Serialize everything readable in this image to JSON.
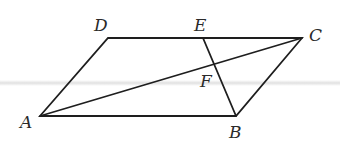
{
  "figure": {
    "type": "parallelogram",
    "points": {
      "A": [
        40,
        116
      ],
      "B": [
        236,
        116
      ],
      "C": [
        302,
        38
      ],
      "D": [
        108,
        38
      ],
      "E": [
        203,
        38
      ],
      "F": [
        214,
        64
      ]
    },
    "segments": [
      "AB",
      "BC",
      "CD",
      "DA",
      "AC",
      "EB"
    ],
    "labels": {
      "A": "A",
      "B": "B",
      "C": "C",
      "D": "D",
      "E": "E",
      "F": "F"
    },
    "colors": {
      "stroke": "#1e1e1e",
      "label": "#2a2a2a"
    }
  }
}
